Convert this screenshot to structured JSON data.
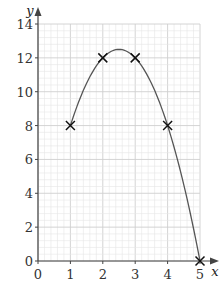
{
  "chart_data": {
    "type": "line",
    "title": "",
    "xlabel": "x",
    "ylabel": "y",
    "xlim": [
      0,
      5
    ],
    "ylim": [
      0,
      14
    ],
    "x_ticks": [
      "0",
      "1",
      "2",
      "3",
      "4",
      "5"
    ],
    "y_ticks": [
      "0",
      "2",
      "4",
      "6",
      "8",
      "10",
      "12",
      "14"
    ],
    "grid": true,
    "points": [
      {
        "x": 1,
        "y": 8
      },
      {
        "x": 2,
        "y": 12
      },
      {
        "x": 3,
        "y": 12
      },
      {
        "x": 4,
        "y": 8
      },
      {
        "x": 5,
        "y": 0
      }
    ],
    "curve": {
      "equation": "y = -2x^2 + 10x",
      "x_range": [
        1,
        5
      ],
      "peak": {
        "x": 2.5,
        "y": 12.5
      }
    },
    "marker": "x",
    "colors": {
      "grid_minor": "#e6e6e6",
      "grid_major": "#cfcfcf",
      "axis": "#444444",
      "curve": "#555555",
      "marker": "#111111"
    }
  }
}
